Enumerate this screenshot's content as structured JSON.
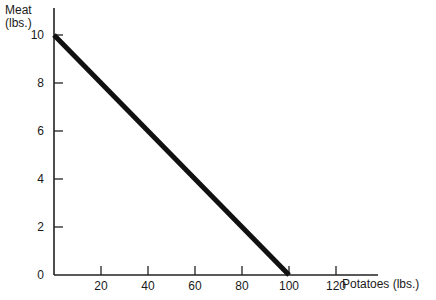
{
  "chart_data": {
    "type": "line",
    "title": "",
    "xlabel": "Potatoes (lbs.)",
    "ylabel_line1": "Meat",
    "ylabel_line2": "(lbs.)",
    "xlim": [
      0,
      130
    ],
    "ylim": [
      0,
      11
    ],
    "x_ticks": [
      20,
      40,
      60,
      80,
      100,
      120
    ],
    "y_ticks": [
      0,
      2,
      4,
      6,
      8,
      10
    ],
    "grid": false,
    "legend": null,
    "series": [
      {
        "name": "Production possibilities",
        "x": [
          0,
          100
        ],
        "y": [
          10,
          0
        ],
        "color": "#111111"
      }
    ]
  }
}
